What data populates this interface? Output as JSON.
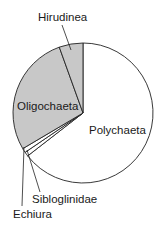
{
  "chart_data": {
    "type": "pie",
    "title": "",
    "start_angle_deg": 0,
    "direction": "clockwise",
    "slices": [
      {
        "label": "Polychaeta",
        "value": 64.5,
        "color": "#ffffff"
      },
      {
        "label": "Sibloglinidae",
        "value": 1.0,
        "color": "#ffffff"
      },
      {
        "label": "Echiura",
        "value": 1.0,
        "color": "#ffffff"
      },
      {
        "label": "Oligochaeta",
        "value": 28.0,
        "color": "#c8c8c8"
      },
      {
        "label": "Hirudinea",
        "value": 5.5,
        "color": "#c8c8c8"
      }
    ],
    "categories": [
      "Polychaeta",
      "Sibloglinidae",
      "Echiura",
      "Oligochaeta",
      "Hirudinea"
    ],
    "values": [
      64.5,
      1.0,
      1.0,
      28.0,
      5.5
    ],
    "units": "percent (estimated)",
    "legend": "none (direct labels)"
  },
  "labels": {
    "polychaeta": "Polychaeta",
    "sibloglinidae": "Sibloglinidae",
    "echiura": "Echiura",
    "oligochaeta": "Oligochaeta",
    "hirudinea": "Hirudinea"
  }
}
